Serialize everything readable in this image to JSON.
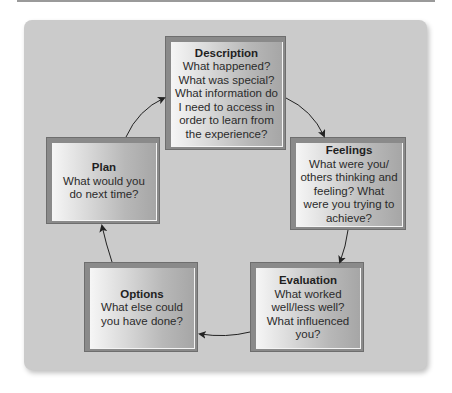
{
  "diagram": {
    "type": "reflective-cycle",
    "colors": {
      "panel": "#cbcbcb",
      "box_border": "#6e6e6e",
      "arrow": "#222222",
      "text": "#2b2b2b"
    },
    "stages": [
      {
        "id": "description",
        "title": "Description",
        "body": "What happened? What was special? What information do I need to access in order to learn from the experience?"
      },
      {
        "id": "feelings",
        "title": "Feelings",
        "body": "What were you/ others thinking and feeling? What were you trying to achieve?"
      },
      {
        "id": "evaluation",
        "title": "Evaluation",
        "body": "What worked well/less well? What influenced you?"
      },
      {
        "id": "options",
        "title": "Options",
        "body": "What else could you have done?"
      },
      {
        "id": "plan",
        "title": "Plan",
        "body": "What would you do next time?"
      }
    ],
    "arrows": [
      {
        "from": "description",
        "to": "feelings"
      },
      {
        "from": "feelings",
        "to": "evaluation"
      },
      {
        "from": "evaluation",
        "to": "options"
      },
      {
        "from": "options",
        "to": "plan"
      },
      {
        "from": "plan",
        "to": "description"
      }
    ]
  }
}
